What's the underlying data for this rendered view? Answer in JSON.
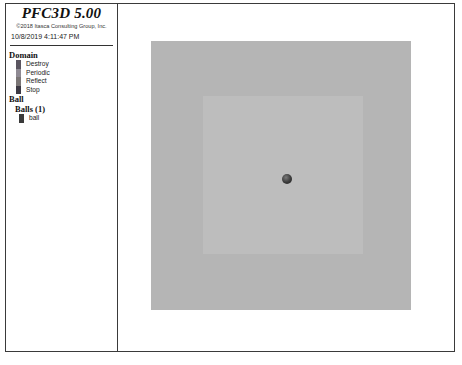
{
  "legend": {
    "title": "PFC3D 5.00",
    "copyright": "©2018 Itasca Consulting Group, Inc.",
    "datetime": "10/8/2019 4:11:47 PM",
    "sections": {
      "domain": {
        "heading": "Domain",
        "items": [
          {
            "label": "Destroy",
            "color": "#5a5560"
          },
          {
            "label": "Periodic",
            "color": "#8f8a93"
          },
          {
            "label": "Reflect",
            "color": "#7b7676"
          },
          {
            "label": "Stop",
            "color": "#3d3a44"
          }
        ]
      },
      "ball": {
        "heading": "Ball",
        "subheading": "Balls (1)",
        "items": [
          {
            "label": "ball",
            "color": "#3a3a3a"
          }
        ]
      }
    }
  },
  "viewport": {
    "domain_outer_color": "#b5b5b5",
    "domain_inner_color": "#bdbdbd",
    "ball": {
      "x": 281,
      "y": 176,
      "radius": 5
    }
  }
}
